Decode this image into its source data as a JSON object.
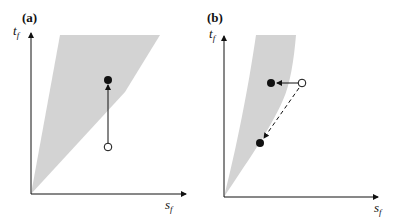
{
  "figure": {
    "panels": [
      {
        "id": "a",
        "label": "(a)",
        "y_axis": {
          "symbol": "t",
          "subscript": "f"
        },
        "x_axis": {
          "symbol": "s",
          "subscript": "f"
        },
        "region": {
          "description": "feasible region (shaded)",
          "color": "#d3d3d3"
        },
        "points": [
          {
            "type": "open",
            "role": "initial"
          },
          {
            "type": "filled",
            "role": "projected"
          }
        ],
        "moves": [
          {
            "style": "solid-arrow",
            "direction": "up",
            "from": "open",
            "to": "filled"
          }
        ]
      },
      {
        "id": "b",
        "label": "(b)",
        "y_axis": {
          "symbol": "t",
          "subscript": "f"
        },
        "x_axis": {
          "symbol": "s",
          "subscript": "f"
        },
        "region": {
          "description": "feasible region (shaded)",
          "color": "#d3d3d3"
        },
        "points": [
          {
            "type": "open",
            "role": "initial"
          },
          {
            "type": "filled",
            "role": "horizontal projection"
          },
          {
            "type": "filled",
            "role": "radial projection"
          }
        ],
        "moves": [
          {
            "style": "solid-arrow",
            "direction": "left",
            "from": "open",
            "to": "filled-upper"
          },
          {
            "style": "dashed-arrow",
            "direction": "down-left",
            "from": "open",
            "to": "filled-lower"
          }
        ]
      }
    ],
    "colors": {
      "ink": "#111111",
      "shade": "#d3d3d3",
      "background": "#ffffff"
    }
  }
}
